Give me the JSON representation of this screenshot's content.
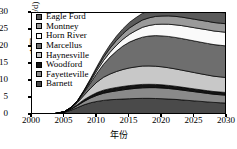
{
  "chart_data": {
    "type": "area",
    "stacked": true,
    "title": "",
    "xlabel": "年份",
    "ylabel": "产量/(10⁸ft³/d)",
    "xlim": [
      2000,
      2030
    ],
    "ylim": [
      0,
      30
    ],
    "xticks": [
      2000,
      2005,
      2010,
      2015,
      2020,
      2025,
      2030
    ],
    "yticks": [
      0,
      5,
      10,
      15,
      20,
      25,
      30
    ],
    "grid": false,
    "legend_position": "top-left",
    "x": [
      2000,
      2001,
      2002,
      2003,
      2004,
      2005,
      2006,
      2007,
      2008,
      2009,
      2010,
      2011,
      2012,
      2013,
      2014,
      2015,
      2016,
      2017,
      2018,
      2019,
      2020,
      2021,
      2022,
      2023,
      2024,
      2025,
      2026,
      2027,
      2028,
      2029,
      2030
    ],
    "series": [
      {
        "name": "Barnett",
        "color": "#4a4a4a",
        "values": [
          0.1,
          0.15,
          0.2,
          0.3,
          0.5,
          0.8,
          1.4,
          2.2,
          3.0,
          3.6,
          4.0,
          4.3,
          4.5,
          4.6,
          4.7,
          4.8,
          4.85,
          4.9,
          4.9,
          4.85,
          4.8,
          4.7,
          4.6,
          4.45,
          4.3,
          4.15,
          4.0,
          3.85,
          3.7,
          3.6,
          3.5
        ]
      },
      {
        "name": "Fayetteville",
        "color": "#8a8a8a",
        "values": [
          0,
          0,
          0,
          0,
          0.05,
          0.1,
          0.3,
          0.6,
          1.0,
          1.4,
          1.8,
          2.1,
          2.3,
          2.5,
          2.7,
          2.85,
          3.0,
          3.1,
          3.15,
          3.2,
          3.15,
          3.1,
          3.0,
          2.9,
          2.8,
          2.7,
          2.6,
          2.5,
          2.4,
          2.35,
          2.3
        ]
      },
      {
        "name": "Woodford",
        "color": "#151515",
        "values": [
          0,
          0,
          0,
          0,
          0.02,
          0.05,
          0.15,
          0.3,
          0.5,
          0.65,
          0.8,
          0.9,
          0.95,
          1.0,
          1.0,
          1.0,
          1.0,
          1.0,
          0.98,
          0.95,
          0.92,
          0.9,
          0.88,
          0.86,
          0.84,
          0.82,
          0.8,
          0.8,
          0.8,
          0.8,
          0.8
        ]
      },
      {
        "name": "Haynesville",
        "color": "#c8c8c8",
        "values": [
          0,
          0,
          0,
          0,
          0,
          0.05,
          0.2,
          0.6,
          1.3,
          2.2,
          3.1,
          3.8,
          4.3,
          4.7,
          5.0,
          5.2,
          5.3,
          5.4,
          5.4,
          5.35,
          5.3,
          5.2,
          5.1,
          5.0,
          4.9,
          4.8,
          4.7,
          4.6,
          4.5,
          4.45,
          4.4
        ]
      },
      {
        "name": "Marcellus",
        "color": "#6e6e6e",
        "values": [
          0,
          0,
          0,
          0,
          0,
          0.02,
          0.1,
          0.3,
          0.8,
          1.6,
          2.6,
          3.8,
          5.0,
          6.0,
          6.9,
          7.6,
          8.1,
          8.5,
          8.8,
          9.0,
          9.1,
          9.2,
          9.25,
          9.3,
          9.3,
          9.3,
          9.3,
          9.3,
          9.3,
          9.3,
          9.3
        ]
      },
      {
        "name": "Horn River",
        "color": "#fafafa",
        "values": [
          0,
          0,
          0,
          0,
          0,
          0,
          0.05,
          0.1,
          0.3,
          0.5,
          0.8,
          1.1,
          1.4,
          1.7,
          2.0,
          2.3,
          2.6,
          2.9,
          3.1,
          3.3,
          3.45,
          3.6,
          3.7,
          3.8,
          3.85,
          3.9,
          3.95,
          4.0,
          4.0,
          4.0,
          4.0
        ]
      },
      {
        "name": "Montney",
        "color": "#9a9a9a",
        "values": [
          0,
          0,
          0,
          0,
          0,
          0,
          0.05,
          0.1,
          0.25,
          0.45,
          0.7,
          0.95,
          1.2,
          1.45,
          1.65,
          1.85,
          2.0,
          2.15,
          2.25,
          2.35,
          2.4,
          2.45,
          2.5,
          2.5,
          2.5,
          2.5,
          2.5,
          2.5,
          2.5,
          2.5,
          2.5
        ]
      },
      {
        "name": "Eagle Ford",
        "color": "#5a5a5a",
        "values": [
          0,
          0,
          0,
          0,
          0,
          0,
          0,
          0.05,
          0.15,
          0.3,
          0.5,
          0.75,
          1.0,
          1.25,
          1.45,
          1.65,
          1.8,
          1.95,
          2.05,
          2.15,
          2.25,
          2.35,
          2.45,
          2.55,
          2.65,
          2.75,
          2.85,
          2.95,
          3.05,
          3.15,
          3.2
        ]
      }
    ],
    "legend_order": [
      "Eagle Ford",
      "Montney",
      "Horn River",
      "Marcellus",
      "Haynesville",
      "Woodford",
      "Fayetteville",
      "Barnett"
    ]
  },
  "legend": {
    "items": [
      {
        "label": "Eagle Ford",
        "color": "#5a5a5a"
      },
      {
        "label": "Montney",
        "color": "#9a9a9a"
      },
      {
        "label": "Horn River",
        "color": "#fafafa"
      },
      {
        "label": "Marcellus",
        "color": "#6e6e6e"
      },
      {
        "label": "Haynesville",
        "color": "#c8c8c8"
      },
      {
        "label": "Woodford",
        "color": "#151515"
      },
      {
        "label": "Fayetteville",
        "color": "#8a8a8a"
      },
      {
        "label": "Barnett",
        "color": "#4a4a4a"
      }
    ]
  },
  "axes": {
    "y_label": "产量/(10⁸ft³/d)",
    "x_label": "年份",
    "y_ticks": [
      "0",
      "5",
      "10",
      "15",
      "20",
      "25",
      "30"
    ],
    "x_ticks": [
      "2000",
      "2005",
      "2010",
      "2015",
      "2020",
      "2025",
      "2030"
    ]
  }
}
